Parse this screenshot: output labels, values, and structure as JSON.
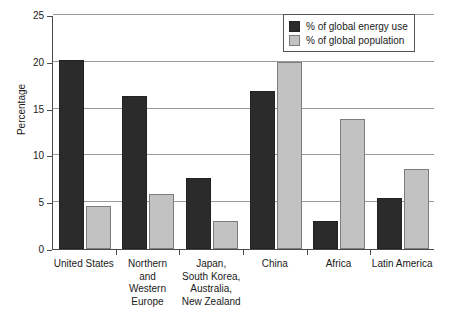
{
  "chart_data": {
    "type": "bar",
    "title": "",
    "xlabel": "",
    "ylabel": "Percentage",
    "ylim": [
      0,
      25
    ],
    "yticks": [
      0,
      5,
      10,
      15,
      20,
      25
    ],
    "ytick_labels": [
      "0",
      "5",
      "10",
      "15",
      "20",
      "25"
    ],
    "grid": true,
    "legend_position": "top-right",
    "categories": [
      "United States",
      "Northern and Western Europe",
      "Japan, South Korea, Australia, New Zealand",
      "China",
      "Africa",
      "Latin America"
    ],
    "category_lines": [
      [
        "United States"
      ],
      [
        "Northern",
        "and",
        "Western",
        "Europe"
      ],
      [
        "Japan,",
        "South Korea,",
        "Australia,",
        "New Zealand"
      ],
      [
        "China"
      ],
      [
        "Africa"
      ],
      [
        "Latin America"
      ]
    ],
    "series": [
      {
        "name": "% of global energy use",
        "color": "#2b2b2b",
        "values": [
          20.2,
          16.3,
          7.6,
          16.9,
          3.0,
          5.4
        ]
      },
      {
        "name": "% of global population",
        "color": "#c2c2c2",
        "values": [
          4.6,
          5.9,
          3.0,
          20.0,
          13.9,
          8.6
        ]
      }
    ]
  },
  "legend": {
    "items": [
      {
        "label": "% of global energy use",
        "swatch": "dark"
      },
      {
        "label": "% of global population",
        "swatch": "light"
      }
    ]
  },
  "axis": {
    "y_title": "Percentage"
  }
}
